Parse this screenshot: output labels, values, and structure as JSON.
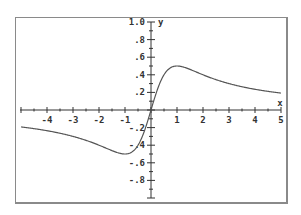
{
  "chart_data": {
    "type": "line",
    "title": "",
    "xlabel": "x",
    "ylabel": "y",
    "xlim": [
      -5,
      5
    ],
    "ylim": [
      -1.0,
      1.0
    ],
    "grid": false,
    "x_tick_labels": [
      "-4",
      "-3",
      "-2",
      "-1",
      "1",
      "2",
      "3",
      "4",
      "5"
    ],
    "y_tick_labels": [
      "1.0",
      ".8",
      ".6",
      ".4",
      ".2",
      "-.2",
      "-.4",
      "-.6",
      "-.8"
    ],
    "series": [
      {
        "name": "y = x/(1+x^2)",
        "x": [
          -5,
          -4,
          -3,
          -2,
          -1.5,
          -1,
          -0.5,
          0,
          0.5,
          1,
          1.5,
          2,
          3,
          4,
          5
        ],
        "y": [
          -0.19,
          -0.24,
          -0.3,
          -0.4,
          -0.46,
          -0.5,
          -0.4,
          0,
          0.4,
          0.5,
          0.46,
          0.4,
          0.3,
          0.24,
          0.19
        ]
      }
    ],
    "colors": {
      "curve": "#555555",
      "axes": "#333333",
      "frame": "#8a8a8a"
    }
  }
}
